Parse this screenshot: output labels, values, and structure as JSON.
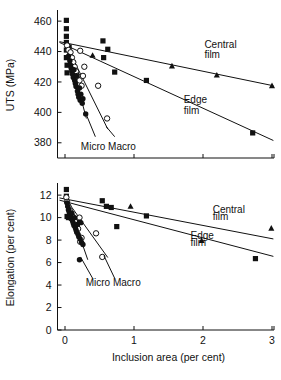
{
  "chart_data": [
    {
      "id": "uts",
      "type": "scatter",
      "title": "",
      "xlabel": "Inclusion area (per cent)",
      "ylabel": "UTS (MPa)",
      "xlim": [
        -0.12,
        3.05
      ],
      "ylim": [
        370,
        466
      ],
      "xticks": [
        0,
        1,
        2,
        3
      ],
      "xticklabels": [
        "0",
        "1",
        "2",
        "3"
      ],
      "yticks": [
        380,
        400,
        420,
        440,
        460
      ],
      "yticklabels": [
        "380",
        "400",
        "420",
        "440",
        "460"
      ],
      "grid": false,
      "legend": "none",
      "annotations": [
        {
          "text": "Central",
          "x": 2.02,
          "y": 442.5
        },
        {
          "text": "film",
          "x": 2.02,
          "y": 435.5
        },
        {
          "text": "Edge",
          "x": 1.72,
          "y": 406.0
        },
        {
          "text": "film",
          "x": 1.72,
          "y": 399.0
        },
        {
          "text": "Micro Macro",
          "x": 0.23,
          "y": 375.5
        }
      ],
      "trendlines": [
        {
          "name": "Central film",
          "x0": -0.08,
          "y0": 446.5,
          "x1": 3.02,
          "y1": 417.5
        },
        {
          "name": "Edge film",
          "x0": -0.08,
          "y0": 446.0,
          "x1": 3.02,
          "y1": 381.5
        },
        {
          "name": "Micro",
          "x0": 0.02,
          "y0": 445.0,
          "x1": 0.31,
          "y1": 396.0
        },
        {
          "name": "Macro",
          "x0": 0.02,
          "y0": 444.0,
          "x1": 0.62,
          "y1": 389.0
        }
      ],
      "series": [
        {
          "name": "filled-square",
          "marker": "filled-square",
          "points": [
            [
              0.02,
              460.5
            ],
            [
              0.02,
              455.0
            ],
            [
              0.02,
              450.0
            ],
            [
              0.02,
              446.0
            ],
            [
              0.02,
              441.0
            ],
            [
              0.02,
              436.0
            ],
            [
              0.03,
              431.0
            ],
            [
              0.03,
              426.0
            ],
            [
              0.06,
              443.0
            ],
            [
              0.07,
              438.0
            ],
            [
              0.09,
              433.0
            ],
            [
              0.55,
              447.0
            ],
            [
              0.62,
              441.5
            ],
            [
              0.56,
              436.0
            ],
            [
              0.72,
              426.5
            ],
            [
              1.18,
              421.0
            ],
            [
              2.72,
              386.5
            ]
          ]
        },
        {
          "name": "open-circle",
          "marker": "open-circle",
          "points": [
            [
              0.03,
              444.0
            ],
            [
              0.05,
              441.0
            ],
            [
              0.08,
              439.5
            ],
            [
              0.1,
              436.0
            ],
            [
              0.12,
              433.0
            ],
            [
              0.14,
              430.0
            ],
            [
              0.16,
              427.0
            ],
            [
              0.18,
              424.0
            ],
            [
              0.21,
              421.0
            ],
            [
              0.24,
              417.5
            ],
            [
              0.28,
              430.0
            ],
            [
              0.26,
              424.0
            ],
            [
              0.22,
              440.5
            ],
            [
              0.48,
              417.5
            ],
            [
              0.61,
              396.0
            ]
          ]
        },
        {
          "name": "filled-circle",
          "marker": "filled-circle",
          "points": [
            [
              0.05,
              437.0
            ],
            [
              0.07,
              434.0
            ],
            [
              0.08,
              431.0
            ],
            [
              0.09,
              429.0
            ],
            [
              0.1,
              427.0
            ],
            [
              0.11,
              425.0
            ],
            [
              0.12,
              423.0
            ],
            [
              0.13,
              428.0
            ],
            [
              0.14,
              421.0
            ],
            [
              0.15,
              419.0
            ],
            [
              0.16,
              417.0
            ],
            [
              0.17,
              424.0
            ],
            [
              0.18,
              414.0
            ],
            [
              0.19,
              412.0
            ],
            [
              0.2,
              410.0
            ],
            [
              0.21,
              416.0
            ],
            [
              0.22,
              408.0
            ],
            [
              0.23,
              412.0
            ],
            [
              0.25,
              406.0
            ],
            [
              0.26,
              409.0
            ],
            [
              0.3,
              399.0
            ]
          ]
        },
        {
          "name": "filled-triangle",
          "marker": "filled-triangle",
          "points": [
            [
              0.4,
              437.5
            ],
            [
              1.55,
              430.5
            ],
            [
              2.2,
              424.5
            ],
            [
              3.0,
              417.5
            ]
          ]
        }
      ]
    },
    {
      "id": "elongation",
      "type": "scatter",
      "title": "",
      "xlabel": "Inclusion area (per cent)",
      "ylabel": "Elongation (per cent)",
      "xlim": [
        -0.12,
        3.05
      ],
      "ylim": [
        0,
        12.9
      ],
      "xticks": [
        0,
        1,
        2,
        3
      ],
      "xticklabels": [
        "0",
        "1",
        "2",
        "3"
      ],
      "yticks": [
        0,
        2,
        4,
        6,
        8,
        10,
        12
      ],
      "yticklabels": [
        "0",
        "2",
        "4",
        "6",
        "8",
        "10",
        "12"
      ],
      "grid": false,
      "legend": "none",
      "annotations": [
        {
          "text": "Central",
          "x": 2.14,
          "y": 10.4
        },
        {
          "text": "film",
          "x": 2.14,
          "y": 9.75
        },
        {
          "text": "Edge",
          "x": 1.82,
          "y": 8.1
        },
        {
          "text": "film",
          "x": 1.82,
          "y": 7.45
        },
        {
          "text": "Micro Macro",
          "x": 0.3,
          "y": 3.95
        }
      ],
      "trendlines": [
        {
          "name": "Central film",
          "x0": -0.08,
          "y0": 11.75,
          "x1": 3.02,
          "y1": 8.1
        },
        {
          "name": "Edge film",
          "x0": -0.08,
          "y0": 11.55,
          "x1": 3.02,
          "y1": 6.55
        },
        {
          "name": "Micro",
          "x0": 0.03,
          "y0": 11.6,
          "x1": 0.33,
          "y1": 6.25
        },
        {
          "name": "Macro",
          "x0": 0.03,
          "y0": 11.5,
          "x1": 0.62,
          "y1": 6.45
        }
      ],
      "series": [
        {
          "name": "filled-square",
          "marker": "filled-square",
          "points": [
            [
              0.02,
              12.5
            ],
            [
              0.02,
              11.9
            ],
            [
              0.03,
              10.1
            ],
            [
              0.05,
              10.0
            ],
            [
              0.09,
              10.0
            ],
            [
              0.12,
              9.85
            ],
            [
              0.54,
              11.5
            ],
            [
              0.6,
              11.0
            ],
            [
              0.67,
              10.9
            ],
            [
              0.75,
              9.2
            ],
            [
              1.18,
              10.15
            ],
            [
              2.76,
              6.35
            ]
          ]
        },
        {
          "name": "open-circle",
          "marker": "open-circle",
          "points": [
            [
              0.02,
              11.8
            ],
            [
              0.03,
              11.4
            ],
            [
              0.05,
              11.0
            ],
            [
              0.07,
              10.6
            ],
            [
              0.09,
              10.3
            ],
            [
              0.11,
              10.1
            ],
            [
              0.13,
              9.9
            ],
            [
              0.15,
              9.6
            ],
            [
              0.17,
              9.3
            ],
            [
              0.19,
              9.0
            ],
            [
              0.21,
              10.0
            ],
            [
              0.24,
              8.2
            ],
            [
              0.22,
              7.85
            ],
            [
              0.45,
              8.6
            ],
            [
              0.54,
              6.5
            ]
          ]
        },
        {
          "name": "filled-circle",
          "marker": "filled-circle",
          "points": [
            [
              0.03,
              11.3
            ],
            [
              0.04,
              11.0
            ],
            [
              0.05,
              10.7
            ],
            [
              0.06,
              10.5
            ],
            [
              0.07,
              10.3
            ],
            [
              0.08,
              10.1
            ],
            [
              0.09,
              9.9
            ],
            [
              0.1,
              10.4
            ],
            [
              0.11,
              9.7
            ],
            [
              0.12,
              9.5
            ],
            [
              0.13,
              9.3
            ],
            [
              0.14,
              10.0
            ],
            [
              0.15,
              9.1
            ],
            [
              0.16,
              8.9
            ],
            [
              0.17,
              8.7
            ],
            [
              0.18,
              9.4
            ],
            [
              0.19,
              8.5
            ],
            [
              0.2,
              8.3
            ],
            [
              0.21,
              9.6
            ],
            [
              0.22,
              8.1
            ],
            [
              0.24,
              7.8
            ],
            [
              0.26,
              7.6
            ],
            [
              0.23,
              9.55
            ],
            [
              0.21,
              6.25
            ]
          ]
        },
        {
          "name": "filled-triangle",
          "marker": "filled-triangle",
          "points": [
            [
              0.95,
              11.0
            ],
            [
              1.98,
              7.95
            ],
            [
              2.99,
              9.05
            ]
          ]
        }
      ]
    }
  ]
}
